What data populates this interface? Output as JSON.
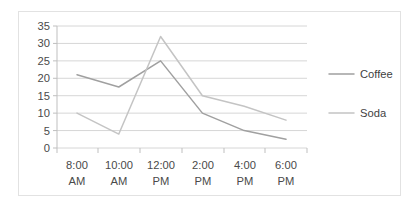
{
  "chart_data": {
    "type": "line",
    "title": "",
    "xlabel": "",
    "ylabel": "",
    "categories": [
      "8:00 AM",
      "10:00 AM",
      "12:00 PM",
      "2:00 PM",
      "4:00 PM",
      "6:00 PM"
    ],
    "category_lines": [
      [
        "8:00",
        "AM"
      ],
      [
        "10:00",
        "AM"
      ],
      [
        "12:00",
        "PM"
      ],
      [
        "2:00",
        "PM"
      ],
      [
        "4:00",
        "PM"
      ],
      [
        "6:00",
        "PM"
      ]
    ],
    "series": [
      {
        "name": "Coffee",
        "color": "#a0a0a0",
        "values": [
          21,
          17.5,
          25,
          10,
          5,
          2.5
        ]
      },
      {
        "name": "Soda",
        "color": "#c4c4c4",
        "values": [
          10,
          4,
          32,
          15,
          12,
          8
        ]
      }
    ],
    "ylim": [
      0,
      35
    ],
    "ytick_step": 5,
    "yticks": [
      "0",
      "5",
      "10",
      "15",
      "20",
      "25",
      "30",
      "35"
    ],
    "grid": true,
    "legend_position": "right",
    "legend_entries": [
      "Coffee",
      "Soda"
    ]
  },
  "axis": {
    "y_labels": [
      "35",
      "30",
      "25",
      "20",
      "15",
      "10",
      "5",
      "0"
    ],
    "x_labels_top": [
      "8:00",
      "10:00",
      "12:00",
      "2:00",
      "4:00",
      "6:00"
    ],
    "x_labels_bottom": [
      "AM",
      "AM",
      "PM",
      "PM",
      "PM",
      "PM"
    ]
  },
  "legend": {
    "items": [
      {
        "label": "Coffee",
        "color": "#a0a0a0"
      },
      {
        "label": "Soda",
        "color": "#c4c4c4"
      }
    ]
  }
}
